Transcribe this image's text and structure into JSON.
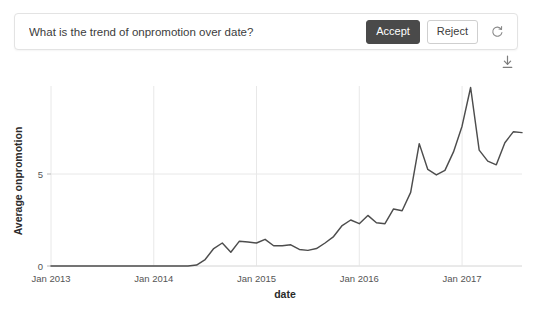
{
  "question_card": {
    "question": "What is the trend of onpromotion over date?",
    "accept_label": "Accept",
    "reject_label": "Reject",
    "refresh_icon": "refresh-icon",
    "accept_bg": "#4a4a4a",
    "reject_border": "#cfcfcf"
  },
  "toolbar": {
    "download_icon": "download-icon"
  },
  "chart_data": {
    "type": "line",
    "title": "",
    "xlabel": "date",
    "ylabel": "Average onpromotion",
    "xtick_labels": [
      "Jan 2013",
      "Jan 2014",
      "Jan 2015",
      "Jan 2016",
      "Jan 2017"
    ],
    "ytick_labels": [
      "0",
      "5"
    ],
    "ytick_values": [
      0,
      5
    ],
    "ylim": [
      0,
      10.2
    ],
    "xlim": [
      "2013-01",
      "2017-08"
    ],
    "grid": true,
    "legend": false,
    "line_color": "#4d4d4d",
    "x": [
      "2013-01",
      "2013-02",
      "2013-03",
      "2013-04",
      "2013-05",
      "2013-06",
      "2013-07",
      "2013-08",
      "2013-09",
      "2013-10",
      "2013-11",
      "2013-12",
      "2014-01",
      "2014-02",
      "2014-03",
      "2014-04",
      "2014-05",
      "2014-06",
      "2014-07",
      "2014-08",
      "2014-09",
      "2014-10",
      "2014-11",
      "2014-12",
      "2015-01",
      "2015-02",
      "2015-03",
      "2015-04",
      "2015-05",
      "2015-06",
      "2015-07",
      "2015-08",
      "2015-09",
      "2015-10",
      "2015-11",
      "2015-12",
      "2016-01",
      "2016-02",
      "2016-03",
      "2016-04",
      "2016-05",
      "2016-06",
      "2016-07",
      "2016-08",
      "2016-09",
      "2016-10",
      "2016-11",
      "2016-12",
      "2017-01",
      "2017-02",
      "2017-03",
      "2017-04",
      "2017-05",
      "2017-06",
      "2017-07",
      "2017-08"
    ],
    "values": [
      0.0,
      0.0,
      0.0,
      0.0,
      0.0,
      0.0,
      0.0,
      0.0,
      0.0,
      0.0,
      0.0,
      0.0,
      0.0,
      0.0,
      0.0,
      0.0,
      0.0,
      0.05,
      0.35,
      0.95,
      1.25,
      0.75,
      1.35,
      1.3,
      1.25,
      1.45,
      1.1,
      1.1,
      1.15,
      0.9,
      0.85,
      0.95,
      1.25,
      1.6,
      2.2,
      2.5,
      2.3,
      2.75,
      2.35,
      2.3,
      3.1,
      3.0,
      4.0,
      6.65,
      5.25,
      4.95,
      5.2,
      6.2,
      7.6,
      9.7,
      6.3,
      5.7,
      5.5,
      6.7,
      7.3,
      7.25
    ]
  }
}
